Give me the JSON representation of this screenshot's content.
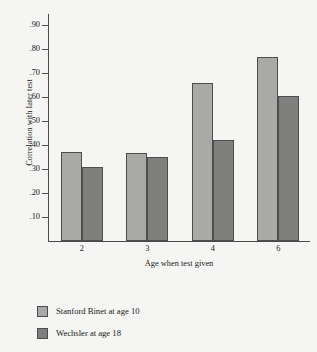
{
  "chart_data": {
    "type": "bar",
    "title": "",
    "xlabel": "Age when test given",
    "ylabel": "Correlation with later test",
    "categories": [
      "2",
      "3",
      "4",
      "6"
    ],
    "ylim": [
      0,
      0.95
    ],
    "yticks": [
      0.1,
      0.2,
      0.3,
      0.4,
      0.5,
      0.6,
      0.7,
      0.8,
      0.9
    ],
    "ytick_labels": [
      ".10",
      ".20",
      ".30",
      ".40",
      ".50",
      ".60",
      ".70",
      ".80",
      ".90"
    ],
    "grid": false,
    "legend_position": "below",
    "series": [
      {
        "name": "Stanford Binet at age 10",
        "color": "#a9a9a7",
        "values": [
          0.37,
          0.365,
          0.66,
          0.765
        ]
      },
      {
        "name": "Wechsler at age 18",
        "color": "#7f7f7e",
        "values": [
          0.31,
          0.35,
          0.42,
          0.605
        ]
      }
    ]
  }
}
